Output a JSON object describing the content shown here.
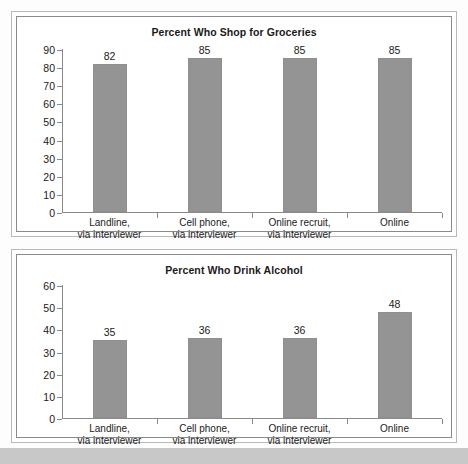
{
  "page": {
    "background_color": "#fdfdfd",
    "bottom_band_color": "#c8c8c8",
    "bar_color": "#949494",
    "axis_color": "#8a8a8a"
  },
  "charts": [
    {
      "id": "groceries",
      "title": "Percent Who Shop for Groceries"
    },
    {
      "id": "alcohol",
      "title": "Percent Who Drink Alcohol"
    }
  ],
  "chart_data": [
    {
      "type": "bar",
      "title": "Percent Who Shop for Groceries",
      "xlabel": "",
      "ylabel": "",
      "ylim": [
        0,
        90
      ],
      "yticks": [
        0,
        10,
        20,
        30,
        40,
        50,
        60,
        70,
        80,
        90
      ],
      "ytick_labels": [
        "0",
        "10",
        "20",
        "30",
        "40",
        "50",
        "60",
        "70",
        "80",
        "90"
      ],
      "grid": false,
      "legend": "none",
      "categories": [
        "Landline,\nvia interviewer",
        "Cell phone,\nvia interviewer",
        "Online recruit,\nvia interviewer",
        "Online"
      ],
      "category_lines": [
        [
          "Landline,",
          "via interviewer"
        ],
        [
          "Cell phone,",
          "via interviewer"
        ],
        [
          "Online recruit,",
          "via interviewer"
        ],
        [
          "Online",
          ""
        ]
      ],
      "values": [
        82,
        85,
        85,
        85
      ],
      "data_labels": [
        "82",
        "85",
        "85",
        "85"
      ]
    },
    {
      "type": "bar",
      "title": "Percent Who Drink Alcohol",
      "xlabel": "",
      "ylabel": "",
      "ylim": [
        0,
        60
      ],
      "yticks": [
        0,
        10,
        20,
        30,
        40,
        50,
        60
      ],
      "ytick_labels": [
        "0",
        "10",
        "20",
        "30",
        "40",
        "50",
        "60"
      ],
      "grid": false,
      "legend": "none",
      "categories": [
        "Landline,\nvia interviewer",
        "Cell phone,\nvia interviewer",
        "Online recruit,\nvia interviewer",
        "Online"
      ],
      "category_lines": [
        [
          "Landline,",
          "via interviewer"
        ],
        [
          "Cell phone,",
          "via interviewer"
        ],
        [
          "Online recruit,",
          "via interviewer"
        ],
        [
          "Online",
          ""
        ]
      ],
      "values": [
        35,
        36,
        36,
        48
      ],
      "data_labels": [
        "35",
        "36",
        "36",
        "48"
      ]
    }
  ]
}
